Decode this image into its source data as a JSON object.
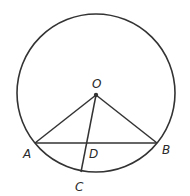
{
  "diagram": {
    "type": "circle-geometry",
    "stroke_color": "#333333",
    "circle": {
      "center": "O",
      "cx": 96,
      "cy": 93,
      "r": 79
    },
    "points": {
      "O": {
        "label": "O",
        "x": 96,
        "y": 95
      },
      "A": {
        "label": "A",
        "x": 35,
        "y": 143
      },
      "B": {
        "label": "B",
        "x": 157,
        "y": 143
      },
      "C": {
        "label": "C",
        "x": 81,
        "y": 172
      },
      "D": {
        "label": "D",
        "x": 86,
        "y": 143
      }
    },
    "segments": [
      "OA",
      "OB",
      "AB",
      "OC"
    ]
  }
}
